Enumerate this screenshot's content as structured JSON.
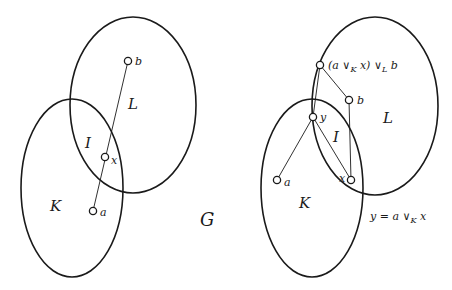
{
  "left_figure": {
    "sets": {
      "L": "L",
      "K": "K",
      "I": "I"
    },
    "nodes": {
      "b": "b",
      "x": "x",
      "a": "a"
    },
    "graph_label": "G"
  },
  "right_figure": {
    "sets": {
      "L": "L",
      "K": "K",
      "I": "I"
    },
    "nodes": {
      "top": {
        "pre": "(a ∨",
        "sub1": "K",
        "mid": " x) ∨",
        "sub2": "L",
        "post": " b"
      },
      "b": "b",
      "y": "y",
      "x": "x",
      "a": "a"
    },
    "equation": {
      "pre": "y = a ∨",
      "sub": "K",
      "post": " x"
    }
  }
}
